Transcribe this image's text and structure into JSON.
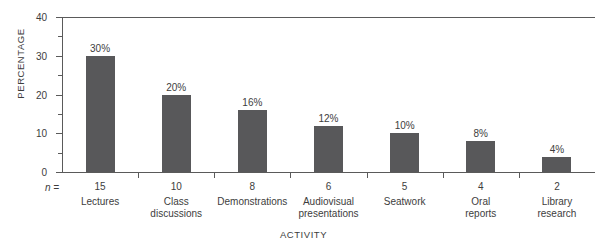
{
  "chart_data": {
    "type": "bar",
    "title": "",
    "xlabel": "ACTIVITY",
    "ylabel": "PERCENTAGE",
    "categories": [
      "Lectures",
      "Class discussions",
      "Demonstrations",
      "Audiovisual presentations",
      "Seatwork",
      "Oral reports",
      "Library research"
    ],
    "values": [
      30,
      20,
      16,
      12,
      10,
      8,
      4
    ],
    "data_labels": [
      "30%",
      "20%",
      "16%",
      "12%",
      "10%",
      "8%",
      "4%"
    ],
    "n_prefix": "n =",
    "n_values": [
      "15",
      "10",
      "8",
      "6",
      "5",
      "4",
      "2"
    ],
    "ylim": [
      0,
      40
    ],
    "y_major_ticks": [
      0,
      10,
      20,
      30,
      40
    ],
    "y_tick_labels": [
      "0",
      "10",
      "20",
      "30",
      "40"
    ],
    "y_minor_ticks": [
      5,
      15,
      25,
      35
    ],
    "grid": false,
    "legend": false,
    "bar_color": "#58585a",
    "axis_color": "#5a5a5a",
    "text_color": "#3d3d3d",
    "background": "#ffffff"
  },
  "category_lines": [
    [
      "Lectures"
    ],
    [
      "Class",
      "discussions"
    ],
    [
      "Demonstrations"
    ],
    [
      "Audiovisual",
      "presentations"
    ],
    [
      "Seatwork"
    ],
    [
      "Oral",
      "reports"
    ],
    [
      "Library",
      "research"
    ]
  ]
}
